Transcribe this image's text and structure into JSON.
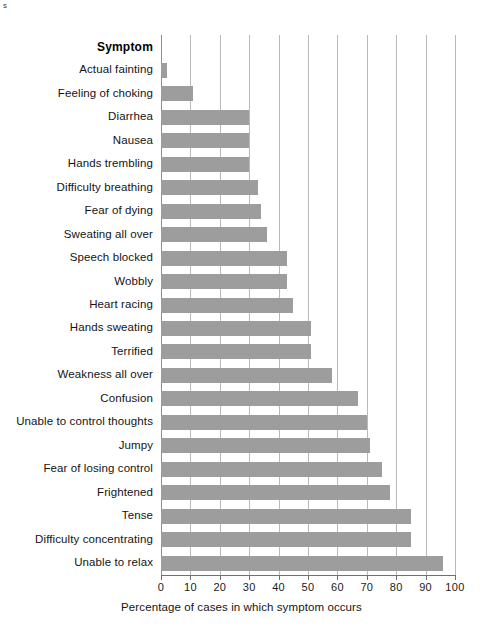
{
  "artifact": {
    "text": "s"
  },
  "chart_data": {
    "type": "bar",
    "orientation": "horizontal",
    "title": "",
    "category_header": "Symptom",
    "xlabel": "Percentage of cases in which symptom occurs",
    "ylabel": "Symptom",
    "xlim": [
      0,
      100
    ],
    "xticks": [
      0,
      10,
      20,
      30,
      40,
      50,
      60,
      70,
      80,
      90,
      100
    ],
    "xtick_labels": [
      "0",
      "10",
      "20",
      "30",
      "40",
      "50",
      "60",
      "70",
      "80",
      "90",
      "100"
    ],
    "grid": true,
    "grid_axis": "x",
    "legend": false,
    "bar_color": "#9d9d9d",
    "gridline_color": "#b9b9b9",
    "axis_color": "#6f6f6f",
    "categories": [
      "Actual fainting",
      "Feeling of choking",
      "Diarrhea",
      "Nausea",
      "Hands trembling",
      "Difficulty breathing",
      "Fear of dying",
      "Sweating all over",
      "Speech blocked",
      "Wobbly",
      "Heart racing",
      "Hands sweating",
      "Terrified",
      "Weakness all over",
      "Confusion",
      "Unable to control thoughts",
      "Jumpy",
      "Fear of losing control",
      "Frightened",
      "Tense",
      "Difficulty concentrating",
      "Unable to relax"
    ],
    "values": [
      2,
      11,
      30,
      30,
      30,
      33,
      34,
      36,
      43,
      43,
      45,
      51,
      51,
      58,
      67,
      70,
      71,
      75,
      78,
      85,
      85,
      96
    ]
  }
}
